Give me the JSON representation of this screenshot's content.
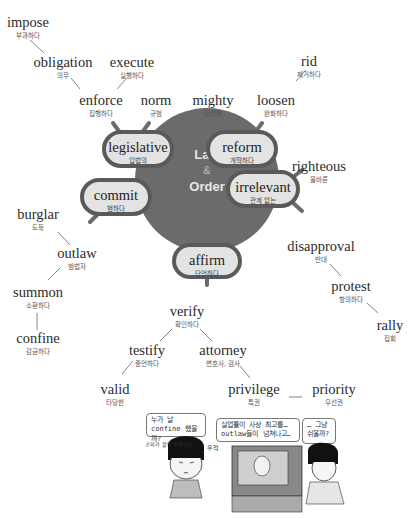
{
  "hub": {
    "line1": "Law",
    "amp": "&",
    "line2": "Order",
    "fill_color": "#6b6b6b",
    "pill_fill": "#e3e3e3",
    "pill_border": "#5a5a5a"
  },
  "pills": {
    "legislative": {
      "en": "legislative",
      "ko": "입법의"
    },
    "reform": {
      "en": "reform",
      "ko": "개혁하다"
    },
    "commit": {
      "en": "commit",
      "ko": "범하다"
    },
    "irrelevant": {
      "en": "irrelevant",
      "ko": "관계 없는"
    },
    "affirm": {
      "en": "affirm",
      "ko": "단언하다"
    }
  },
  "words": {
    "impose": {
      "en": "impose",
      "ko": "부과하다"
    },
    "obligation": {
      "en": "obligation",
      "ko": "의무"
    },
    "execute": {
      "en": "execute",
      "ko": "실행하다"
    },
    "enforce": {
      "en": "enforce",
      "ko": "집행하다"
    },
    "norm": {
      "en": "norm",
      "ko": "규범"
    },
    "mighty": {
      "en": "mighty",
      "ko": "강력한"
    },
    "loosen": {
      "en": "loosen",
      "ko": "완화하다"
    },
    "rid": {
      "en": "rid",
      "ko": "제거하다"
    },
    "righteous": {
      "en": "righteous",
      "ko": "올바른"
    },
    "disapproval": {
      "en": "disapproval",
      "ko": "반대"
    },
    "protest": {
      "en": "protest",
      "ko": "항의하다"
    },
    "rally": {
      "en": "rally",
      "ko": "집회"
    },
    "burglar": {
      "en": "burglar",
      "ko": "도둑"
    },
    "outlaw": {
      "en": "outlaw",
      "ko": "범법자"
    },
    "summon": {
      "en": "summon",
      "ko": "소환하다"
    },
    "confine": {
      "en": "confine",
      "ko": "감금하다"
    },
    "verify": {
      "en": "verify",
      "ko": "확인하다"
    },
    "testify": {
      "en": "testify",
      "ko": "증언하다"
    },
    "attorney": {
      "en": "attorney",
      "ko": "변호사, 검사"
    },
    "valid": {
      "en": "valid",
      "ko": "타당한"
    },
    "privilege": {
      "en": "privilege",
      "ko": "특권"
    },
    "priority": {
      "en": "priority",
      "ko": "우선권"
    }
  },
  "comic": {
    "bubble1": "누가 날 confine 했을까?",
    "bubble2": "실업률이 사상 최고를… outlaw들이 넘쳐나고…",
    "bubble3": "… 그냥 쉬울까?",
    "sfx_left": "코피가 왈칵 쏟아지는…",
    "sfx_right": "우적"
  }
}
